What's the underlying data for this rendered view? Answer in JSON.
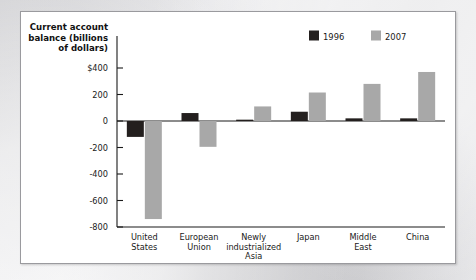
{
  "chart_data": {
    "type": "bar",
    "title": "",
    "axis_title_lines": [
      "Current account",
      "balance (billions",
      "of dollars)"
    ],
    "categories": [
      "United States",
      "European Union",
      "Newly industrialized Asia",
      "Japan",
      "Middle East",
      "China"
    ],
    "category_label_lines": [
      [
        "United",
        "States"
      ],
      [
        "European",
        "Union"
      ],
      [
        "Newly",
        "industrialized",
        "Asia"
      ],
      [
        "Japan"
      ],
      [
        "Middle",
        "East"
      ],
      [
        "China"
      ]
    ],
    "series": [
      {
        "name": "1996",
        "color": "#231f1e",
        "values": [
          -120,
          60,
          10,
          70,
          20,
          20
        ]
      },
      {
        "name": "2007",
        "color": "#a8a8a8",
        "values": [
          -740,
          -195,
          110,
          215,
          280,
          370
        ]
      }
    ],
    "xlabel": "",
    "ylabel": "Current account balance (billions of dollars)",
    "ylim": [
      -800,
      400
    ],
    "yticks": [
      400,
      200,
      0,
      -200,
      -400,
      -600,
      -800
    ],
    "ytick_labels": [
      "$400",
      "200",
      "0",
      "-200",
      "-400",
      "-600",
      "-800"
    ],
    "grid": false,
    "legend_position": "top-right",
    "legend_entries": [
      {
        "label": "1996",
        "color": "#231f1e"
      },
      {
        "label": "2007",
        "color": "#a8a8a8"
      }
    ]
  }
}
